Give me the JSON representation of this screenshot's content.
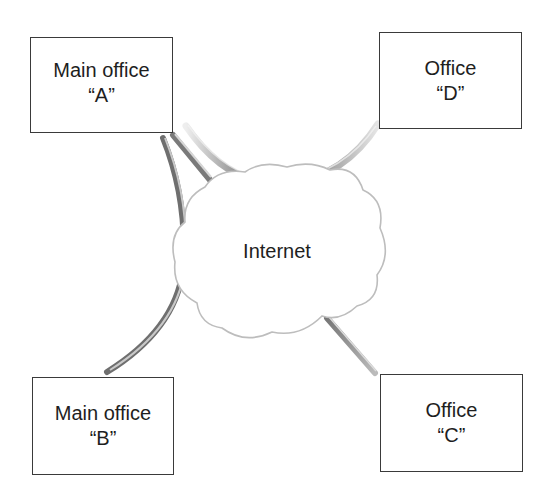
{
  "diagram": {
    "nodes": [
      {
        "id": "A",
        "line1": "Main office",
        "line2": "“A”"
      },
      {
        "id": "D",
        "line1": "Office",
        "line2": "“D”"
      },
      {
        "id": "B",
        "line1": "Main office",
        "line2": "“B”"
      },
      {
        "id": "C",
        "line1": "Office",
        "line2": "“C”"
      }
    ],
    "cloud": {
      "label": "Internet"
    },
    "edges": [
      {
        "from": "A",
        "to": "Internet"
      },
      {
        "from": "A",
        "to": "B"
      },
      {
        "from": "A",
        "to": "D"
      },
      {
        "from": "Internet",
        "to": "C"
      }
    ],
    "colors": {
      "box_border": "#3a3a3a",
      "text": "#1e1e1e",
      "cloud_outline": "#b8b8b8",
      "tube_dark": "#5a5a5a",
      "tube_light": "#e0e0e0"
    }
  }
}
